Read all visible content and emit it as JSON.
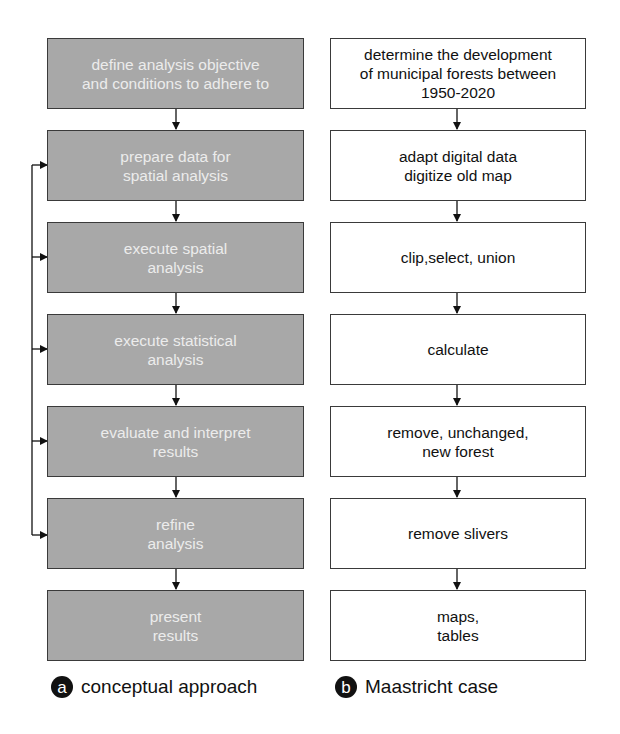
{
  "left_column": {
    "caption_badge": "a",
    "caption": "conceptual approach",
    "steps": [
      {
        "label": "define analysis objective\nand conditions to adhere to"
      },
      {
        "label": "prepare data for\nspatial analysis"
      },
      {
        "label": "execute spatial\nanalysis"
      },
      {
        "label": "execute statistical\nanalysis"
      },
      {
        "label": "evaluate and interpret\nresults"
      },
      {
        "label": "refine\nanalysis"
      },
      {
        "label": "present\nresults"
      }
    ]
  },
  "right_column": {
    "caption_badge": "b",
    "caption": "Maastricht case",
    "steps": [
      {
        "label": "determine the development\nof municipal forests between\n1950-2020"
      },
      {
        "label": "adapt digital data\ndigitize old map"
      },
      {
        "label": "clip,select, union"
      },
      {
        "label": "calculate"
      },
      {
        "label": "remove, unchanged,\nnew forest"
      },
      {
        "label": "remove slivers"
      },
      {
        "label": "maps,\ntables"
      }
    ]
  },
  "colors": {
    "gray_box": "#a8a8a8",
    "border": "#3a3a3a",
    "gray_text": "#ececec"
  }
}
